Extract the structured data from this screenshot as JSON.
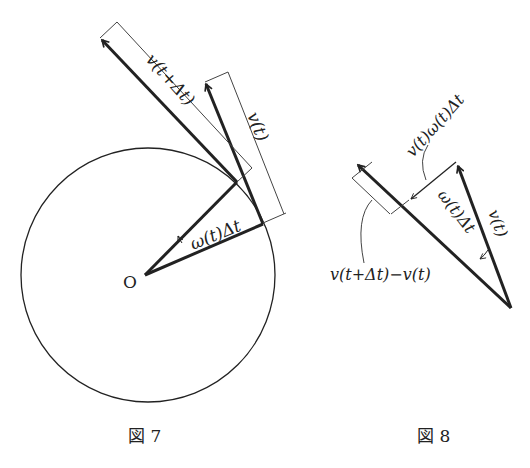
{
  "figure7": {
    "caption": "図 7",
    "center_label": "O",
    "labels": {
      "v_next": "v(t+Δt)",
      "v_now": "v(t)",
      "angle": "ω(t)Δt"
    }
  },
  "figure8": {
    "caption": "図 8",
    "labels": {
      "v_now": "v(t)",
      "angle": "ω(t)Δt",
      "perp_segment": "v(t)ω(t)Δt",
      "difference": "v(t+Δt)−v(t)"
    }
  },
  "colors": {
    "ink": "#222222",
    "background": "#ffffff"
  }
}
